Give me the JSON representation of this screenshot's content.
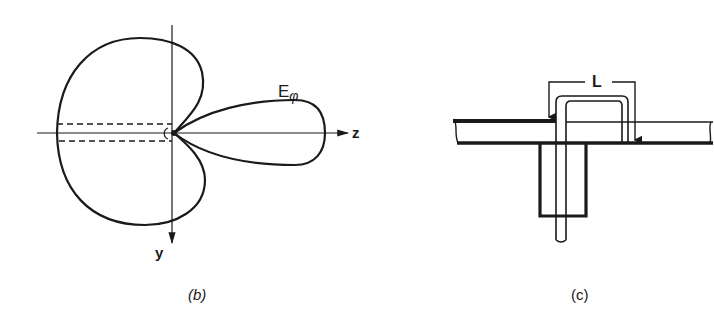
{
  "figure_b": {
    "caption": "(b)",
    "pattern_label": "E",
    "pattern_subscript": "φ",
    "axis_z_label": "z",
    "axis_y_label": "y"
  },
  "figure_c": {
    "caption": "(c)",
    "dimension_label": "L"
  },
  "colors": {
    "ink": "#1a1a1a",
    "background": "#ffffff"
  }
}
